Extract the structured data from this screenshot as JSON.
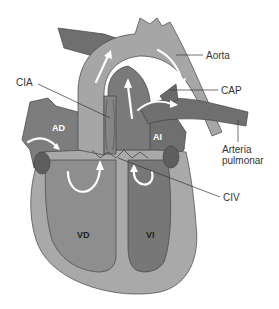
{
  "diagram": {
    "title": "",
    "labels": {
      "aorta": "Aorta",
      "cap": "CAP",
      "cia": "CIA",
      "arteria_line1": "Arteria",
      "arteria_line2": "pulmonar",
      "civ": "CIV",
      "ad": "AD",
      "ai": "AI",
      "vd": "VD",
      "vi": "VI"
    },
    "colors": {
      "background": "#ffffff",
      "myocardium": "#a9a9a9",
      "aorta": "#a6a6a6",
      "right_chambers": "#8e8e8e",
      "left_chambers": "#777777",
      "vessels_dark": "#6f6f6f",
      "valve_dark": "#5a5a5a",
      "flow_arrows": "#ffffff",
      "text": "#333333"
    }
  }
}
